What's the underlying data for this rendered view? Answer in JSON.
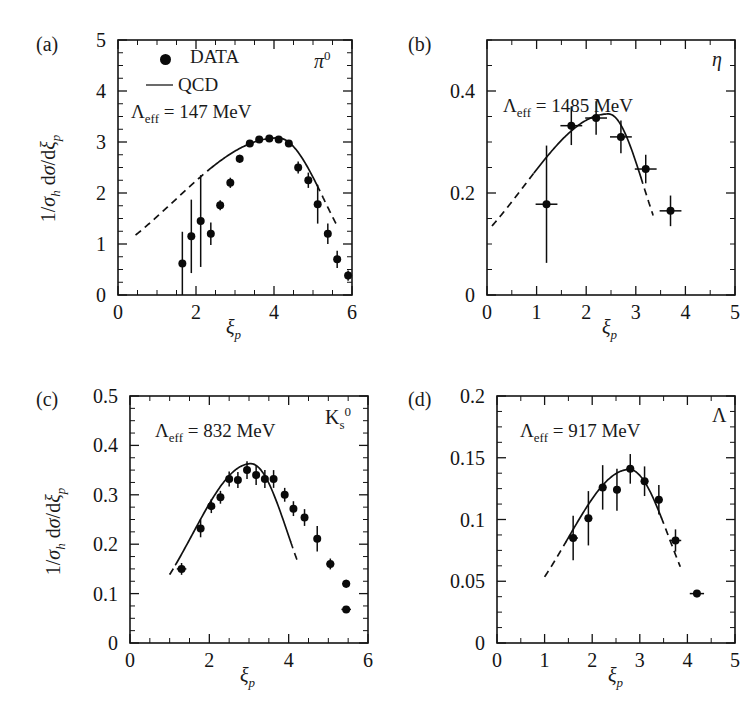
{
  "figure": {
    "background": "#ffffff",
    "ink_color": "#141414",
    "panel_count": 4
  },
  "legend": {
    "data_label": "DATA",
    "qcd_label": "QCD",
    "data_marker": "filled-circle-icon",
    "qcd_marker": "solid-line-icon"
  },
  "axis_titles": {
    "x": "ξ",
    "x_sub": "p",
    "y_prefix": "1/σ",
    "y_sub1": "h",
    "y_mid": " dσ/dξ",
    "y_sub2": "p"
  },
  "chart_data": [
    {
      "panel": "a",
      "panel_label": "(a)",
      "type": "scatter",
      "species": "π",
      "species_sup": "0",
      "annotation_prefix": "Λ",
      "annotation_sub": "eff",
      "annotation_value": "= 147 MeV",
      "lambda_eff_mev": 147,
      "title": "",
      "xlabel": "ξ_p",
      "ylabel": "1/σ_h dσ/dξ_p",
      "xlim": [
        0,
        6
      ],
      "ylim": [
        0,
        5
      ],
      "xticks": [
        0,
        2,
        4,
        6
      ],
      "xticklabels": [
        "0",
        "2",
        "4",
        "6"
      ],
      "xminor_step": 0.5,
      "yticks": [
        0,
        1,
        2,
        3,
        4,
        5
      ],
      "yticklabels": [
        "0",
        "1",
        "2",
        "3",
        "4",
        "5"
      ],
      "yminor_step": 0.25,
      "grid": false,
      "legend_position": "top-left",
      "x": [
        1.65,
        1.88,
        2.12,
        2.38,
        2.62,
        2.88,
        3.12,
        3.38,
        3.62,
        3.88,
        4.12,
        4.38,
        4.62,
        4.88,
        5.12,
        5.38,
        5.62,
        5.9
      ],
      "y": [
        0.62,
        1.15,
        1.45,
        1.2,
        1.76,
        2.2,
        2.67,
        2.97,
        3.05,
        3.07,
        3.05,
        2.97,
        2.5,
        2.25,
        1.78,
        1.2,
        0.7,
        0.38
      ],
      "yerr": [
        0.62,
        0.72,
        0.9,
        0.22,
        0.1,
        0.1,
        0.08,
        0.07,
        0.06,
        0.06,
        0.06,
        0.07,
        0.12,
        0.15,
        0.38,
        0.2,
        0.17,
        0.1
      ],
      "xerr": [
        0.06,
        0.06,
        0.06,
        0.06,
        0.06,
        0.06,
        0.06,
        0.06,
        0.06,
        0.06,
        0.06,
        0.06,
        0.06,
        0.06,
        0.06,
        0.06,
        0.06,
        0.06
      ],
      "qcd_solid_range": [
        2.35,
        5.1
      ],
      "qcd_dashed_low_range": [
        0.45,
        2.35
      ],
      "qcd_dashed_high_range": [
        5.1,
        5.62
      ],
      "qcd_peak_x": 4.1,
      "qcd_peak_y": 3.08
    },
    {
      "panel": "b",
      "panel_label": "(b)",
      "type": "scatter",
      "species": "η",
      "species_sup": "",
      "annotation_prefix": "Λ",
      "annotation_sub": "eff",
      "annotation_value": "= 1485 MeV",
      "lambda_eff_mev": 1485,
      "title": "",
      "xlabel": "ξ_p",
      "ylabel": "",
      "xlim": [
        0,
        5
      ],
      "ylim": [
        0,
        0.5
      ],
      "xticks": [
        0,
        1,
        2,
        3,
        4,
        5
      ],
      "xticklabels": [
        "0",
        "1",
        "2",
        "3",
        "4",
        "5"
      ],
      "xminor_step": 0.5,
      "yticks": [
        0,
        0.2,
        0.4
      ],
      "yticklabels": [
        "0",
        "0.2",
        "0.4"
      ],
      "yminor_step": 0.05,
      "grid": false,
      "legend_position": "none",
      "x": [
        1.2,
        1.7,
        2.2,
        2.7,
        3.2,
        3.7
      ],
      "y": [
        0.178,
        0.332,
        0.347,
        0.31,
        0.247,
        0.165
      ],
      "yerr": [
        0.115,
        0.038,
        0.033,
        0.032,
        0.028,
        0.03
      ],
      "xerr": [
        0.22,
        0.22,
        0.22,
        0.22,
        0.22,
        0.22
      ],
      "qcd_solid_range": [
        0.95,
        3.1
      ],
      "qcd_dashed_low_range": [
        0.1,
        0.95
      ],
      "qcd_dashed_high_range": [
        3.1,
        3.35
      ],
      "qcd_peak_x": 2.45,
      "qcd_peak_y": 0.355
    },
    {
      "panel": "c",
      "panel_label": "(c)",
      "type": "scatter",
      "species": "K",
      "species_sub": "s",
      "species_sup": "0",
      "annotation_prefix": "Λ",
      "annotation_sub": "eff",
      "annotation_value": "= 832 MeV",
      "lambda_eff_mev": 832,
      "title": "",
      "xlabel": "ξ_p",
      "ylabel": "1/σ_h dσ/dξ_p",
      "xlim": [
        0,
        6
      ],
      "ylim": [
        0,
        0.5
      ],
      "xticks": [
        0,
        2,
        4,
        6
      ],
      "xticklabels": [
        "0",
        "2",
        "4",
        "6"
      ],
      "xminor_step": 0.5,
      "yticks": [
        0,
        0.1,
        0.2,
        0.3,
        0.4,
        0.5
      ],
      "yticklabels": [
        "0",
        "0.1",
        "0.2",
        "0.3",
        "0.4",
        "0.5"
      ],
      "yminor_step": 0.025,
      "grid": false,
      "legend_position": "none",
      "x": [
        1.3,
        1.78,
        2.05,
        2.28,
        2.5,
        2.72,
        2.95,
        3.18,
        3.4,
        3.62,
        3.9,
        4.12,
        4.4,
        4.72,
        5.05,
        5.45
      ],
      "y": [
        0.15,
        0.232,
        0.277,
        0.295,
        0.332,
        0.33,
        0.35,
        0.34,
        0.332,
        0.332,
        0.3,
        0.272,
        0.254,
        0.211,
        0.16,
        0.12
      ],
      "y_extra_last": 0.068,
      "yerr": [
        0.012,
        0.018,
        0.014,
        0.013,
        0.015,
        0.016,
        0.018,
        0.02,
        0.018,
        0.018,
        0.014,
        0.015,
        0.017,
        0.026,
        0.011,
        0.008
      ],
      "xerr": [
        0.12,
        0.06,
        0.06,
        0.06,
        0.06,
        0.06,
        0.06,
        0.06,
        0.06,
        0.06,
        0.06,
        0.06,
        0.06,
        0.06,
        0.1,
        0.1
      ],
      "qcd_solid_range": [
        1.15,
        4.05
      ],
      "qcd_dashed_low_range": [
        1.0,
        1.15
      ],
      "qcd_dashed_high_range": [
        4.05,
        4.25
      ],
      "qcd_peak_x": 3.05,
      "qcd_peak_y": 0.363
    },
    {
      "panel": "d",
      "panel_label": "(d)",
      "type": "scatter",
      "species": "Λ",
      "species_sup": "",
      "annotation_prefix": "Λ",
      "annotation_sub": "eff",
      "annotation_value": "= 917 MeV",
      "lambda_eff_mev": 917,
      "title": "",
      "xlabel": "ξ_p",
      "ylabel": "",
      "xlim": [
        0,
        5
      ],
      "ylim": [
        0,
        0.2
      ],
      "xticks": [
        0,
        1,
        2,
        3,
        4,
        5
      ],
      "xticklabels": [
        "0",
        "1",
        "2",
        "3",
        "4",
        "5"
      ],
      "xminor_step": 0.5,
      "yticks": [
        0,
        0.05,
        0.1,
        0.15,
        0.2
      ],
      "yticklabels": [
        "0",
        "0.05",
        "0.1",
        "0.15",
        "0.2"
      ],
      "yminor_step": 0.0125,
      "grid": false,
      "legend_position": "none",
      "x": [
        1.6,
        1.92,
        2.22,
        2.52,
        2.8,
        3.1,
        3.4,
        3.75,
        4.2
      ],
      "y": [
        0.085,
        0.101,
        0.126,
        0.124,
        0.141,
        0.131,
        0.116,
        0.083,
        0.04
      ],
      "yerr": [
        0.018,
        0.022,
        0.018,
        0.017,
        0.012,
        0.012,
        0.012,
        0.009,
        0.003
      ],
      "xerr": [
        0.1,
        0.08,
        0.08,
        0.08,
        0.08,
        0.08,
        0.08,
        0.12,
        0.15
      ],
      "qcd_solid_range": [
        1.45,
        3.45
      ],
      "qcd_dashed_low_range": [
        1.0,
        1.45
      ],
      "qcd_dashed_high_range": [
        3.45,
        3.85
      ],
      "qcd_peak_x": 2.78,
      "qcd_peak_y": 0.1405
    }
  ]
}
